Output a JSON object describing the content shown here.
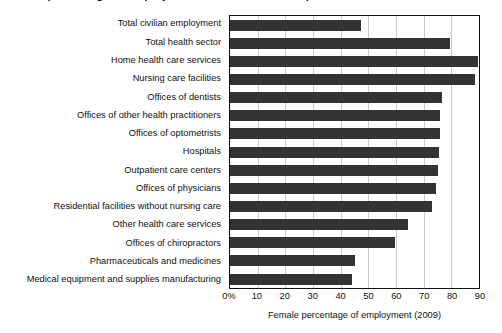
{
  "title": {
    "text": "Female percentage of employment in health care occupations"
  },
  "axis": {
    "xlabel": "Female percentage of employment (2009)",
    "xticks": [
      "0%",
      "10",
      "20",
      "30",
      "40",
      "50",
      "60",
      "70",
      "80",
      "90"
    ]
  },
  "colors": {
    "bar": "#333333",
    "grid": "#c9c9c9",
    "frame": "#111111",
    "text": "#111111"
  },
  "chart_data": {
    "type": "bar",
    "orientation": "horizontal",
    "title": "Female percentage of employment in health care occupations",
    "xlabel": "Female percentage of employment (2009)",
    "ylabel": "",
    "xlim": [
      0,
      90
    ],
    "grid": true,
    "legend": null,
    "categories": [
      "Total civilian employment",
      "Total health sector",
      "Home health care services",
      "Nursing care facilities",
      "Offices of dentists",
      "Offices of other health practitioners",
      "Offices of optometrists",
      "Hospitals",
      "Outpatient care centers",
      "Offices of physicians",
      "Residential facilities without nursing care",
      "Other health care services",
      "Offices of chiropractors",
      "Pharmaceuticals and medicines",
      "Medical equipment and supplies manufacturing"
    ],
    "values": [
      47.5,
      79.5,
      89.5,
      88.5,
      76.5,
      76,
      76,
      75.5,
      75,
      74.5,
      73,
      64.5,
      59.5,
      45,
      44
    ],
    "xticklabels": [
      "0%",
      "10",
      "20",
      "30",
      "40",
      "50",
      "60",
      "70",
      "80",
      "90"
    ],
    "xtickvalues": [
      0,
      10,
      20,
      30,
      40,
      50,
      60,
      70,
      80,
      90
    ]
  }
}
